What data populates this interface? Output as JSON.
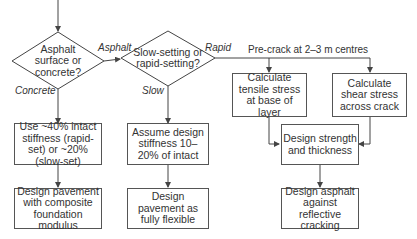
{
  "flowchart": {
    "decisions": [
      {
        "id": "d1",
        "text": "Asphalt surface or concrete?"
      },
      {
        "id": "d2",
        "text": "Slow-setting or rapid-setting?"
      }
    ],
    "edge_labels": {
      "asphalt": "Asphalt",
      "concrete": "Concrete",
      "rapid": "Rapid",
      "slow": "Slow"
    },
    "note": "Pre-crack at 2–3 m centres",
    "boxes": [
      {
        "id": "b1",
        "text": "Use ~40% intact stiffness (rapid-set) or ~20% (slow-set)"
      },
      {
        "id": "b2",
        "text": "Assume design stiffness 10–20% of intact"
      },
      {
        "id": "b3",
        "text": "Calculate tensile stress at base of layer"
      },
      {
        "id": "b4",
        "text": "Calculate shear stress across crack"
      },
      {
        "id": "b5",
        "text": "Design strength and thickness"
      },
      {
        "id": "b6",
        "text": "Design asphalt against reflective cracking"
      },
      {
        "id": "b7",
        "text": "Design pavement with composite foundation modulus"
      },
      {
        "id": "b8",
        "text": "Design pavement as fully flexible"
      }
    ],
    "colors": {
      "line": "#444444",
      "text": "#333333",
      "background": "#ffffff"
    }
  }
}
